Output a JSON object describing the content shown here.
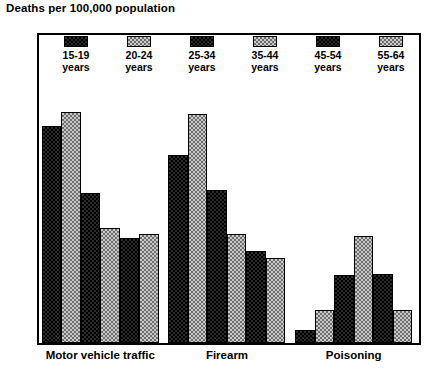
{
  "chart_data": {
    "type": "bar",
    "title": "Deaths per 100,000 population",
    "xlabel": "",
    "ylabel": "",
    "ylim": [
      0,
      40
    ],
    "yticks": [
      0,
      5,
      10,
      15,
      20,
      25,
      30,
      35,
      40
    ],
    "grid": false,
    "legend_position": "top-inside",
    "categories": [
      "Motor vehicle traffic",
      "Firearm",
      "Poisoning"
    ],
    "series": [
      {
        "name": "15-19 years",
        "swatch": "dark",
        "values": [
          28.2,
          24.4,
          1.7
        ]
      },
      {
        "name": "20-24 years",
        "swatch": "light",
        "values": [
          30.0,
          29.8,
          4.3
        ]
      },
      {
        "name": "25-34 years",
        "swatch": "dark",
        "values": [
          19.5,
          19.9,
          8.8
        ]
      },
      {
        "name": "35-44 years",
        "swatch": "light",
        "values": [
          14.9,
          14.1,
          13.9
        ]
      },
      {
        "name": "45-54 years",
        "swatch": "dark",
        "values": [
          13.7,
          12.0,
          8.9
        ]
      },
      {
        "name": "55-64 years",
        "swatch": "light",
        "values": [
          14.2,
          11.1,
          4.3
        ]
      }
    ]
  },
  "axis": {
    "tick_labels": [
      "40",
      "35",
      "30",
      "25",
      "20",
      "15",
      "10",
      "5",
      "0"
    ]
  },
  "legend": {
    "items": [
      {
        "line1": "15-19",
        "line2": "years"
      },
      {
        "line1": "20-24",
        "line2": "years"
      },
      {
        "line1": "25-34",
        "line2": "years"
      },
      {
        "line1": "35-44",
        "line2": "years"
      },
      {
        "line1": "45-54",
        "line2": "years"
      },
      {
        "line1": "55-64",
        "line2": "years"
      }
    ]
  }
}
